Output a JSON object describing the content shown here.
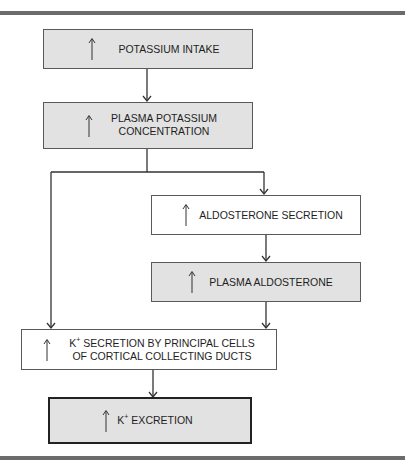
{
  "diagram": {
    "type": "flowchart",
    "boxes": [
      {
        "id": "b1",
        "up_arrow": true,
        "label": "POTASSIUM INTAKE",
        "lines": [
          "POTASSIUM INTAKE"
        ],
        "style": "shaded"
      },
      {
        "id": "b2",
        "up_arrow": true,
        "label": "PLASMA POTASSIUM CONCENTRATION",
        "lines": [
          "PLASMA POTASSIUM",
          "CONCENTRATION"
        ],
        "style": "shaded"
      },
      {
        "id": "b3",
        "up_arrow": true,
        "label": "ALDOSTERONE SECRETION",
        "lines": [
          "ALDOSTERONE SECRETION"
        ],
        "style": "plain"
      },
      {
        "id": "b4",
        "up_arrow": true,
        "label": "PLASMA ALDOSTERONE",
        "lines": [
          "PLASMA ALDOSTERONE"
        ],
        "style": "shaded"
      },
      {
        "id": "b5",
        "up_arrow": true,
        "label": "K+ SECRETION BY PRINCIPAL CELLS OF CORTICAL COLLECTING DUCTS",
        "lines": [
          "K",
          "+",
          " SECRETION BY PRINCIPAL CELLS",
          "OF CORTICAL COLLECTING DUCTS"
        ],
        "style": "plain"
      },
      {
        "id": "b6",
        "up_arrow": true,
        "label": "K+ EXCRETION",
        "lines": [
          "K",
          "+",
          " EXCRETION"
        ],
        "style": "shaded-bold"
      }
    ],
    "edges": [
      {
        "from": "b1",
        "to": "b2"
      },
      {
        "from": "b2",
        "to": "b3"
      },
      {
        "from": "b2",
        "to": "b5"
      },
      {
        "from": "b3",
        "to": "b4"
      },
      {
        "from": "b4",
        "to": "b5"
      },
      {
        "from": "b5",
        "to": "b6"
      }
    ],
    "colors": {
      "shaded": "#e2e2e2",
      "border": "#5a5a5a",
      "rule": "#6b6b6b",
      "line": "#333333"
    }
  }
}
